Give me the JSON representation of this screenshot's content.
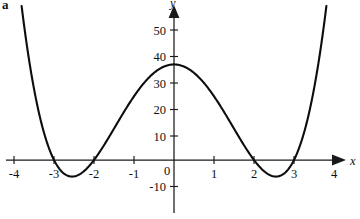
{
  "figure": {
    "panel_label": "a",
    "background_color": "#ffffff",
    "curve_color": "#0d0d0d",
    "axis_color": "#1a1a1a"
  },
  "chart_data": {
    "type": "line",
    "title": "",
    "subtitle": "",
    "xlabel": "x",
    "ylabel": "y",
    "xlim": [
      -4.25,
      4.25
    ],
    "ylim": [
      -13,
      56
    ],
    "grid": false,
    "legend": null,
    "function": "y = x^4 - 13x^2 + 36",
    "x_ticks": [
      -4,
      -3,
      -2,
      -1,
      0,
      1,
      2,
      3,
      4
    ],
    "x_tick_labels": [
      "-4",
      "-3",
      "-2",
      "-1",
      "0",
      "1",
      "2",
      "3",
      "4"
    ],
    "y_ticks": [
      -10,
      10,
      20,
      30,
      40,
      50
    ],
    "y_tick_labels": [
      "-10",
      "10",
      "20",
      "30",
      "40",
      "50"
    ],
    "zero_label": "0",
    "roots": [
      -3,
      -2,
      2,
      3
    ],
    "local_maximum": {
      "x": 0,
      "y": 36
    },
    "local_minima": [
      {
        "x": -2.5495,
        "y": -6.25
      },
      {
        "x": 2.5495,
        "y": -6.25
      }
    ],
    "series": [
      {
        "name": "y = x^4 - 13x^2 + 36",
        "x": [
          -4.12,
          -4.0,
          -3.8,
          -3.6,
          -3.4,
          -3.2,
          -3.0,
          -2.8,
          -2.6,
          -2.4,
          -2.2,
          -2.0,
          -1.8,
          -1.6,
          -1.4,
          -1.2,
          -1.0,
          -0.8,
          -0.6,
          -0.4,
          -0.2,
          0.0,
          0.2,
          0.4,
          0.6,
          0.8,
          1.0,
          1.2,
          1.4,
          1.6,
          1.8,
          2.0,
          2.2,
          2.4,
          2.6,
          2.8,
          3.0,
          3.2,
          3.4,
          3.6,
          3.8,
          4.0,
          4.12
        ],
        "y": [
          67.5,
          60.0,
          41.9,
          31.4,
          3.3,
          2.7,
          0.0,
          -2.4,
          -4.2,
          -5.6,
          -6.2,
          0.0,
          -1.7,
          -0.7,
          2.6,
          9.4,
          24.0,
          28.3,
          31.5,
          33.9,
          35.5,
          36.0,
          35.5,
          33.9,
          31.5,
          28.3,
          24.0,
          9.4,
          2.6,
          -0.7,
          -1.7,
          0.0,
          -6.2,
          -5.6,
          -4.2,
          -2.4,
          0.0,
          2.7,
          3.3,
          31.4,
          41.9,
          60.0,
          67.5
        ]
      }
    ]
  }
}
